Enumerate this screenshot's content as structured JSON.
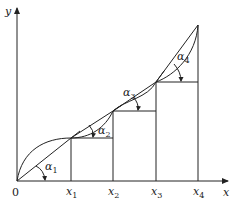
{
  "diagram": {
    "axes": {
      "x_label": "x",
      "y_label": "y",
      "origin_label": "0"
    },
    "x_ticks": [
      {
        "base": "x",
        "sub": "1"
      },
      {
        "base": "x",
        "sub": "2"
      },
      {
        "base": "x",
        "sub": "3"
      },
      {
        "base": "x",
        "sub": "4"
      }
    ],
    "angles": [
      {
        "base": "α",
        "sub": "1"
      },
      {
        "base": "α",
        "sub": "2"
      },
      {
        "base": "α",
        "sub": "3"
      },
      {
        "base": "α",
        "sub": "4"
      }
    ],
    "colors": {
      "line": "#222222",
      "background": "#ffffff"
    }
  }
}
